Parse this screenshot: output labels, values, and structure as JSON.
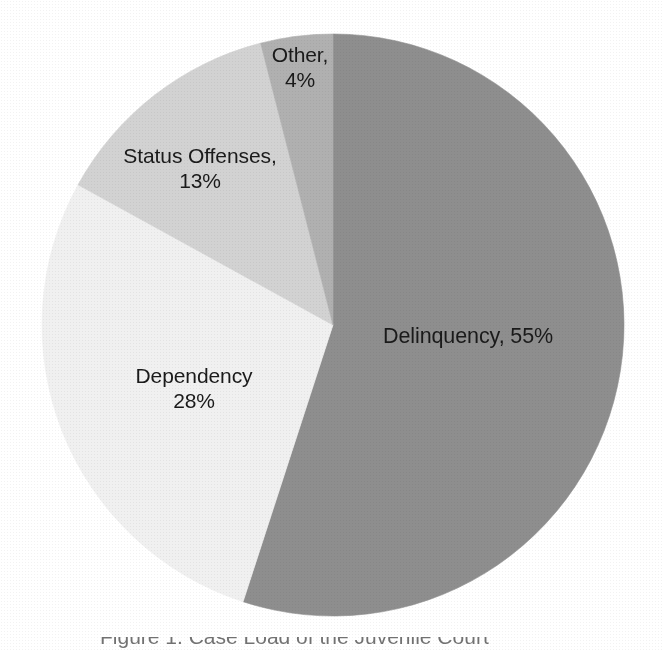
{
  "figure": {
    "background_color": "#ffffff",
    "caption_partial": "Figure 1. Case Load of the Juvenile Court"
  },
  "chart_data": {
    "type": "pie",
    "title": "",
    "subtitle": "",
    "xlabel": "",
    "ylabel": "",
    "legend_position": "none",
    "grid": false,
    "units": "percent",
    "total": 100,
    "start_angle_deg": 0,
    "direction": "clockwise",
    "categories": [
      "Delinquency",
      "Dependency",
      "Status Offenses",
      "Other"
    ],
    "values": [
      55,
      28,
      13,
      4
    ],
    "colors": [
      "#8e8e8e",
      "#f0f0f0",
      "#d2d2d2",
      "#b0b0b0"
    ],
    "slices": [
      {
        "name": "Delinquency",
        "value": 55,
        "value_label": "55%",
        "color": "#8e8e8e",
        "start_deg": 0,
        "end_deg": 198,
        "label_line_1": "Delinquency, 55%",
        "label_line_2": ""
      },
      {
        "name": "Dependency",
        "value": 28,
        "value_label": "28%",
        "color": "#f0f0f0",
        "start_deg": 198,
        "end_deg": 298.8,
        "label_line_1": "Dependency",
        "label_line_2": "28%"
      },
      {
        "name": "Status Offenses",
        "value": 13,
        "value_label": "13%",
        "color": "#d2d2d2",
        "start_deg": 298.8,
        "end_deg": 345.6,
        "label_line_1": "Status Offenses,",
        "label_line_2": "13%"
      },
      {
        "name": "Other",
        "value": 4,
        "value_label": "4%",
        "color": "#b0b0b0",
        "start_deg": 345.6,
        "end_deg": 360,
        "label_line_1": "Other,",
        "label_line_2": "4%"
      }
    ]
  }
}
